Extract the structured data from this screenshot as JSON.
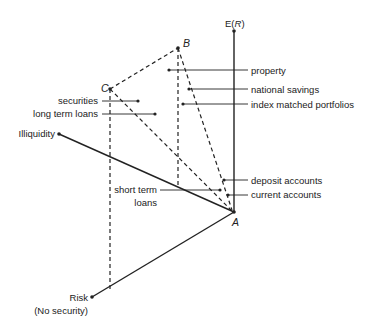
{
  "axes": {
    "return": "E(R)",
    "return_italic": "R",
    "illiquidity": "Illiquidity",
    "risk": "Risk",
    "risk_sub": "(No security)"
  },
  "points": {
    "A": "A",
    "B": "B",
    "C": "C"
  },
  "labels": {
    "property": "property",
    "national_savings": "national savings",
    "index_matched": "index matched portfolios",
    "securities": "securities",
    "long_term_loans": "long term loans",
    "deposit_accounts": "deposit accounts",
    "current_accounts": "current accounts",
    "short_term_line1": "short term",
    "short_term_line2": "loans"
  },
  "colors": {
    "ink": "#222222",
    "background": "#ffffff"
  }
}
